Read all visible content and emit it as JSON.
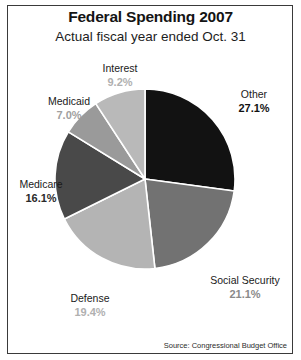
{
  "header": {
    "title": "Federal Spending 2007",
    "subtitle": "Actual fiscal year ended Oct. 31"
  },
  "footer": {
    "source": "Source: Congressional Budget Office"
  },
  "chart_data": {
    "type": "pie",
    "title": "Federal Spending 2007",
    "subtitle": "Actual fiscal year ended Oct. 31",
    "source": "Source: Congressional Budget Office",
    "units": "percent of total federal spending",
    "start_angle_deg": 0,
    "direction": "clockwise",
    "separator_color": "#ffffff",
    "legend": "none (direct labels outside slices)",
    "categories": [
      "Other",
      "Social Security",
      "Defense",
      "Medicare",
      "Medicaid",
      "Interest"
    ],
    "values": [
      27.1,
      21.1,
      19.4,
      16.1,
      7.0,
      9.2
    ],
    "slices": [
      {
        "label": "Other",
        "value": 27.1,
        "value_text": "27.1%",
        "color": "#121212",
        "value_color": "#111111"
      },
      {
        "label": "Social Security",
        "value": 21.1,
        "value_text": "21.1%",
        "color": "#727272",
        "value_color": "#8a8a8a"
      },
      {
        "label": "Defense",
        "value": 19.4,
        "value_text": "19.4%",
        "color": "#b4b4b4",
        "value_color": "#b0b0b0"
      },
      {
        "label": "Medicare",
        "value": 16.1,
        "value_text": "16.1%",
        "color": "#494949",
        "value_color": "#2a2a2a"
      },
      {
        "label": "Medicaid",
        "value": 7.0,
        "value_text": "7.0%",
        "color": "#9a9a9a",
        "value_color": "#a0a0a0"
      },
      {
        "label": "Interest",
        "value": 9.2,
        "value_text": "9.2%",
        "color": "#b9b9b9",
        "value_color": "#b0b0b0"
      }
    ]
  }
}
